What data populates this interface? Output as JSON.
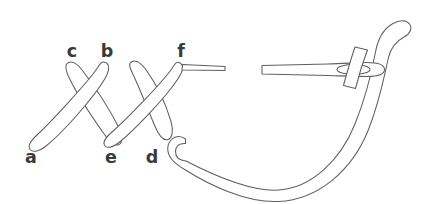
{
  "figure": {
    "background_color": "#ffffff",
    "line_color": "#5f5f5f",
    "label_color": "#3a3a3a",
    "width": 424,
    "height": 204
  },
  "labels": [
    {
      "id": "c",
      "text": "c",
      "x": 72,
      "y": 57,
      "role": "stitch-point"
    },
    {
      "id": "b",
      "text": "b",
      "x": 107,
      "y": 57,
      "role": "stitch-point"
    },
    {
      "id": "f",
      "text": "f",
      "x": 181,
      "y": 57,
      "role": "stitch-point"
    },
    {
      "id": "a",
      "text": "a",
      "x": 31,
      "y": 163,
      "role": "stitch-point"
    },
    {
      "id": "e",
      "text": "e",
      "x": 111,
      "y": 163,
      "role": "stitch-point"
    },
    {
      "id": "d",
      "text": "d",
      "x": 152,
      "y": 163,
      "role": "stitch-point"
    }
  ],
  "elements": {
    "stitch_1_label": "first cross stitch",
    "stitch_2_label": "second cross stitch",
    "needle_label": "sewing needle",
    "needle_eye_label": "needle eye",
    "thread_label": "working thread",
    "thread_tail_label": "thread tail at f"
  }
}
